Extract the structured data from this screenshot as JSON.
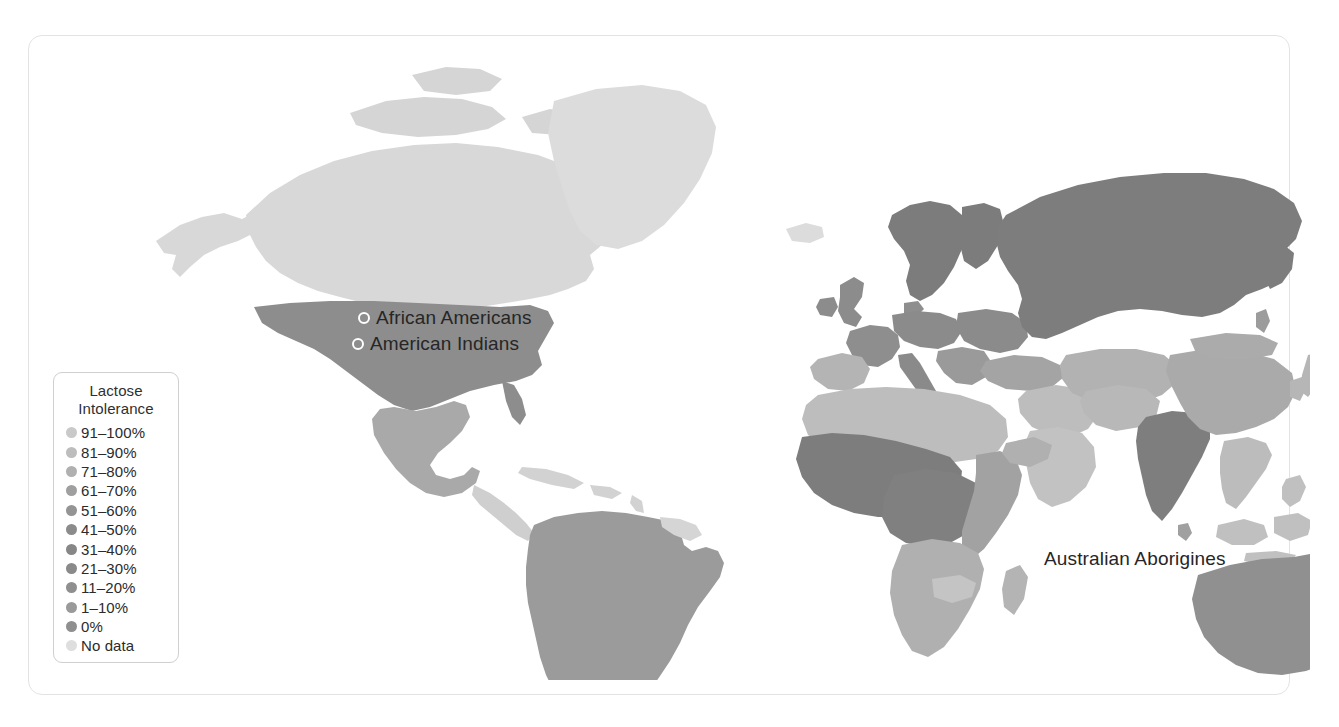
{
  "figure": {
    "kind": "choropleth-world-map",
    "background": "#ffffff",
    "card_border_color": "#e3e3e3"
  },
  "legend": {
    "title_line1": "Lactose",
    "title_line2": "Intolerance",
    "border_color": "#cfcfcf",
    "items": [
      {
        "label": "91–100%",
        "color": "#c9c9c9"
      },
      {
        "label": "81–90%",
        "color": "#bdbdbd"
      },
      {
        "label": "71–80%",
        "color": "#b0b0b0"
      },
      {
        "label": "61–70%",
        "color": "#9f9f9f"
      },
      {
        "label": "51–60%",
        "color": "#949494"
      },
      {
        "label": "41–50%",
        "color": "#8b8b8b"
      },
      {
        "label": "31–40%",
        "color": "#878787"
      },
      {
        "label": "21–30%",
        "color": "#8a8a8a"
      },
      {
        "label": "11–20%",
        "color": "#8f8f8f"
      },
      {
        "label": "1–10%",
        "color": "#9a9a9a"
      },
      {
        "label": "0%",
        "color": "#8f8f8f"
      },
      {
        "label": "No data",
        "color": "#dedede"
      }
    ]
  },
  "map_labels": [
    {
      "id": "african-americans",
      "text": "African Americans"
    },
    {
      "id": "american-indians",
      "text": "American Indians"
    },
    {
      "id": "australian-aborigines",
      "text": "Australian Aborigines"
    }
  ],
  "chart_data": {
    "type": "map",
    "title": "Lactose Intolerance",
    "projection": "world",
    "value_unit": "percent of population with lactose intolerance",
    "legend_position": "left",
    "bins": [
      "91–100%",
      "81–90%",
      "71–80%",
      "61–70%",
      "51–60%",
      "41–50%",
      "31–40%",
      "21–30%",
      "11–20%",
      "1–10%",
      "0%",
      "No data"
    ],
    "no_data_color": "#dedede",
    "annotated_populations": [
      "African Americans",
      "American Indians",
      "Australian Aborigines"
    ],
    "regions": [
      {
        "name": "Greenland",
        "bin": "No data",
        "color": "#dcdcdc"
      },
      {
        "name": "Canada / Arctic",
        "bin": "No data",
        "color": "#d8d8d8"
      },
      {
        "name": "Alaska",
        "bin": "No data",
        "color": "#d8d8d8"
      },
      {
        "name": "United States",
        "bin": "11–20%",
        "color": "#8d8d8d"
      },
      {
        "name": "Mexico",
        "bin": "81–90%",
        "color": "#a9a9a9"
      },
      {
        "name": "Central America",
        "bin": "No data",
        "color": "#cfcfcf"
      },
      {
        "name": "Caribbean",
        "bin": "No data",
        "color": "#d2d2d2"
      },
      {
        "name": "South America",
        "bin": "51–60%",
        "color": "#9b9b9b"
      },
      {
        "name": "Guyanas",
        "bin": "No data",
        "color": "#d5d5d5"
      },
      {
        "name": "Iceland",
        "bin": "No data",
        "color": "#dcdcdc"
      },
      {
        "name": "British Isles",
        "bin": "1–10%",
        "color": "#8c8c8c"
      },
      {
        "name": "Scandinavia",
        "bin": "1–10%",
        "color": "#7c7c7c"
      },
      {
        "name": "Western Europe",
        "bin": "11–20%",
        "color": "#8e8e8e"
      },
      {
        "name": "Iberia",
        "bin": "21–30%",
        "color": "#b4b4b4"
      },
      {
        "name": "Italy",
        "bin": "41–50%",
        "color": "#8a8a8a"
      },
      {
        "name": "Balkans",
        "bin": "31–40%",
        "color": "#9a9a9a"
      },
      {
        "name": "Eastern Europe",
        "bin": "21–30%",
        "color": "#8b8b8b"
      },
      {
        "name": "Russia",
        "bin": "11–20%",
        "color": "#7d7d7d"
      },
      {
        "name": "Turkey / Caucasus",
        "bin": "61–70%",
        "color": "#a4a4a4"
      },
      {
        "name": "Middle East",
        "bin": "81–90%",
        "color": "#bdbdbd"
      },
      {
        "name": "Arabian Peninsula",
        "bin": "81–90%",
        "color": "#c2c2c2"
      },
      {
        "name": "Central Asia",
        "bin": "71–80%",
        "color": "#b2b2b2"
      },
      {
        "name": "India",
        "bin": "41–50%",
        "color": "#7e7e7e"
      },
      {
        "name": "China",
        "bin": "81–90%",
        "color": "#aaaaaa"
      },
      {
        "name": "Mongolia",
        "bin": "81–90%",
        "color": "#ababab"
      },
      {
        "name": "Japan / Korea",
        "bin": "91–100%",
        "color": "#b6b6b6"
      },
      {
        "name": "Southeast Asia",
        "bin": "91–100%",
        "color": "#bcbcbc"
      },
      {
        "name": "Indonesia",
        "bin": "91–100%",
        "color": "#c0c0c0"
      },
      {
        "name": "North Africa",
        "bin": "81–90%",
        "color": "#bdbdbd"
      },
      {
        "name": "West Africa",
        "bin": "41–50%",
        "color": "#7d7d7d"
      },
      {
        "name": "Central Africa",
        "bin": "41–50%",
        "color": "#808080"
      },
      {
        "name": "East Africa",
        "bin": "71–80%",
        "color": "#a2a2a2"
      },
      {
        "name": "Southern Africa",
        "bin": "71–80%",
        "color": "#b0b0b0"
      },
      {
        "name": "Madagascar",
        "bin": "71–80%",
        "color": "#b4b4b4"
      },
      {
        "name": "Australia",
        "bin": "21–30%",
        "color": "#909090"
      },
      {
        "name": "New Zealand",
        "bin": "No data",
        "color": "#d4d4d4"
      },
      {
        "name": "Papua New Guinea",
        "bin": "No data",
        "color": "#cdcdcd"
      }
    ]
  }
}
